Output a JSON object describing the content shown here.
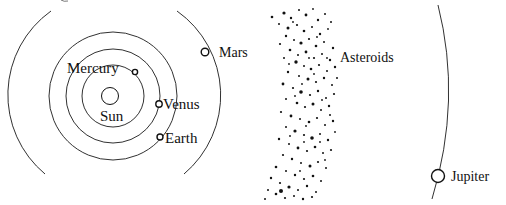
{
  "figure": {
    "type": "solar-system-diagram",
    "background": "#ffffff",
    "ink": "#111111"
  },
  "sun": {
    "label": "Sun"
  },
  "planets": [
    {
      "name": "Mercury",
      "label": "Mercury"
    },
    {
      "name": "Venus",
      "label": "Venus"
    },
    {
      "name": "Earth",
      "label": "Earth"
    },
    {
      "name": "Mars",
      "label": "Mars"
    },
    {
      "name": "Jupiter",
      "label": "Jupiter"
    }
  ],
  "asteroid_belt": {
    "label": "Asteroids"
  },
  "asteroids": [
    [
      284,
      13,
      1.6
    ],
    [
      291,
      18,
      1.2
    ],
    [
      299,
      10,
      1.0
    ],
    [
      306,
      15,
      1.4
    ],
    [
      313,
      9,
      0.9
    ],
    [
      318,
      20,
      1.2
    ],
    [
      325,
      14,
      1.0
    ],
    [
      272,
      17,
      1.3
    ],
    [
      279,
      24,
      1.0
    ],
    [
      288,
      28,
      1.5
    ],
    [
      297,
      25,
      1.1
    ],
    [
      304,
      31,
      1.3
    ],
    [
      312,
      27,
      1.0
    ],
    [
      320,
      34,
      1.2
    ],
    [
      328,
      29,
      0.9
    ],
    [
      331,
      22,
      1.0
    ],
    [
      286,
      36,
      1.2
    ],
    [
      294,
      40,
      1.0
    ],
    [
      301,
      43,
      1.6
    ],
    [
      309,
      39,
      1.1
    ],
    [
      316,
      46,
      1.3
    ],
    [
      324,
      42,
      1.0
    ],
    [
      333,
      48,
      1.2
    ],
    [
      280,
      44,
      1.1
    ],
    [
      290,
      50,
      1.3
    ],
    [
      298,
      55,
      1.0
    ],
    [
      306,
      52,
      1.4
    ],
    [
      314,
      58,
      1.1
    ],
    [
      322,
      54,
      1.0
    ],
    [
      330,
      60,
      1.2
    ],
    [
      284,
      58,
      1.0
    ],
    [
      296,
      62,
      1.7
    ],
    [
      304,
      66,
      1.0
    ],
    [
      311,
      69,
      1.3
    ],
    [
      319,
      65,
      1.1
    ],
    [
      327,
      71,
      1.0
    ],
    [
      335,
      67,
      1.2
    ],
    [
      288,
      72,
      1.2
    ],
    [
      299,
      76,
      1.0
    ],
    [
      308,
      79,
      1.5
    ],
    [
      316,
      82,
      1.1
    ],
    [
      324,
      78,
      1.2
    ],
    [
      332,
      85,
      1.0
    ],
    [
      283,
      84,
      1.4
    ],
    [
      293,
      88,
      1.1
    ],
    [
      301,
      92,
      1.8
    ],
    [
      310,
      95,
      1.1
    ],
    [
      318,
      91,
      1.2
    ],
    [
      326,
      98,
      1.0
    ],
    [
      334,
      94,
      1.1
    ],
    [
      286,
      99,
      1.0
    ],
    [
      297,
      103,
      1.3
    ],
    [
      305,
      107,
      1.1
    ],
    [
      313,
      104,
      1.5
    ],
    [
      321,
      110,
      1.0
    ],
    [
      329,
      106,
      1.2
    ],
    [
      281,
      112,
      1.1
    ],
    [
      291,
      116,
      1.4
    ],
    [
      300,
      119,
      1.0
    ],
    [
      309,
      122,
      1.3
    ],
    [
      317,
      118,
      1.1
    ],
    [
      325,
      125,
      1.0
    ],
    [
      333,
      121,
      1.2
    ],
    [
      286,
      127,
      1.0
    ],
    [
      295,
      131,
      1.6
    ],
    [
      304,
      135,
      1.1
    ],
    [
      312,
      138,
      1.8
    ],
    [
      320,
      134,
      1.0
    ],
    [
      328,
      140,
      1.2
    ],
    [
      279,
      139,
      1.2
    ],
    [
      289,
      144,
      1.0
    ],
    [
      298,
      148,
      1.4
    ],
    [
      307,
      151,
      1.1
    ],
    [
      315,
      147,
      1.3
    ],
    [
      323,
      153,
      1.0
    ],
    [
      331,
      150,
      1.1
    ],
    [
      283,
      155,
      1.1
    ],
    [
      292,
      159,
      1.2
    ],
    [
      301,
      163,
      1.0
    ],
    [
      310,
      166,
      1.5
    ],
    [
      318,
      162,
      1.1
    ],
    [
      326,
      168,
      1.0
    ],
    [
      276,
      167,
      1.3
    ],
    [
      286,
      171,
      1.0
    ],
    [
      295,
      175,
      1.2
    ],
    [
      304,
      179,
      1.1
    ],
    [
      313,
      176,
      1.3
    ],
    [
      321,
      181,
      1.0
    ],
    [
      271,
      178,
      1.2
    ],
    [
      280,
      183,
      1.1
    ],
    [
      289,
      187,
      1.6
    ],
    [
      298,
      190,
      1.0
    ],
    [
      307,
      186,
      1.2
    ],
    [
      316,
      192,
      1.0
    ],
    [
      268,
      190,
      1.0
    ],
    [
      276,
      194,
      1.3
    ],
    [
      285,
      198,
      1.1
    ],
    [
      294,
      196,
      1.0
    ],
    [
      303,
      199,
      1.2
    ],
    [
      312,
      197,
      1.1
    ],
    [
      265,
      199,
      1.0
    ],
    [
      281,
      191,
      2.0
    ],
    [
      330,
      115,
      1.0
    ],
    [
      337,
      78,
      1.0
    ],
    [
      302,
      84,
      0.9
    ],
    [
      314,
      74,
      0.9
    ],
    [
      295,
      96,
      0.9
    ],
    [
      320,
      142,
      0.9
    ],
    [
      306,
      126,
      0.9
    ],
    [
      300,
      171,
      0.9
    ],
    [
      322,
      100,
      0.9
    ],
    [
      309,
      58,
      0.9
    ],
    [
      293,
      22,
      0.9
    ],
    [
      317,
      37,
      0.9
    ],
    [
      327,
      58,
      0.9
    ],
    [
      289,
      64,
      0.9
    ],
    [
      335,
      132,
      0.9
    ],
    [
      290,
      136,
      0.9
    ],
    [
      304,
      142,
      0.9
    ],
    [
      325,
      160,
      0.9
    ]
  ]
}
